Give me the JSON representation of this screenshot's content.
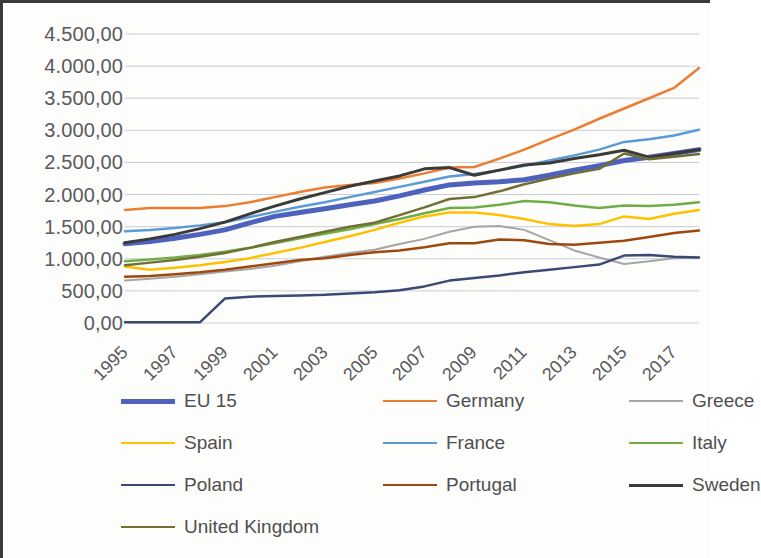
{
  "chart_data": {
    "type": "line",
    "title": "",
    "xlabel": "",
    "ylabel": "",
    "grid": true,
    "legend_position": "bottom",
    "ylim": [
      0,
      4500
    ],
    "ytick_labels": [
      "4.500,00",
      "4.000,00",
      "3.500,00",
      "3.000,00",
      "2.500,00",
      "2.000,00",
      "1.500,00",
      "1.000,00",
      "500,00",
      "0,00"
    ],
    "ytick_values": [
      4500,
      4000,
      3500,
      3000,
      2500,
      2000,
      1500,
      1000,
      500,
      0
    ],
    "xtick_labels": [
      "1995",
      "1997",
      "1999",
      "2001",
      "2003",
      "2005",
      "2007",
      "2009",
      "2011",
      "2013",
      "2015",
      "2017"
    ],
    "x": [
      1995,
      1996,
      1997,
      1998,
      1999,
      2000,
      2001,
      2002,
      2003,
      2004,
      2005,
      2006,
      2007,
      2008,
      2009,
      2010,
      2011,
      2012,
      2013,
      2014,
      2015,
      2016,
      2017,
      2018
    ],
    "series": [
      {
        "name": "EU 15",
        "color": "#4d61bd",
        "width": 5,
        "values": [
          1235,
          1270,
          1320,
          1380,
          1450,
          1560,
          1660,
          1720,
          1780,
          1840,
          1900,
          1980,
          2070,
          2150,
          2180,
          2200,
          2230,
          2300,
          2380,
          2450,
          2530,
          2580,
          2640,
          2700
        ]
      },
      {
        "name": "Germany",
        "color": "#ed7d31",
        "width": 2.5,
        "values": [
          1760,
          1790,
          1790,
          1790,
          1820,
          1880,
          1960,
          2040,
          2110,
          2150,
          2180,
          2250,
          2330,
          2420,
          2430,
          2560,
          2700,
          2860,
          3010,
          3180,
          3340,
          3500,
          3660,
          3970
        ]
      },
      {
        "name": "Greece",
        "color": "#a5a5a5",
        "width": 2,
        "values": [
          660,
          690,
          720,
          760,
          800,
          840,
          890,
          960,
          1030,
          1090,
          1140,
          1230,
          1310,
          1420,
          1500,
          1510,
          1450,
          1290,
          1130,
          1020,
          920,
          960,
          1010,
          1020
        ]
      },
      {
        "name": "Spain",
        "color": "#ffc000",
        "width": 2.5,
        "values": [
          880,
          830,
          860,
          900,
          950,
          1010,
          1090,
          1170,
          1260,
          1350,
          1450,
          1560,
          1660,
          1720,
          1720,
          1680,
          1620,
          1540,
          1510,
          1540,
          1660,
          1620,
          1700,
          1760
        ]
      },
      {
        "name": "France",
        "color": "#5b9bd5",
        "width": 2.5,
        "values": [
          1430,
          1450,
          1480,
          1520,
          1570,
          1650,
          1730,
          1810,
          1880,
          1960,
          2040,
          2120,
          2200,
          2280,
          2320,
          2380,
          2450,
          2530,
          2610,
          2700,
          2820,
          2860,
          2920,
          3010
        ]
      },
      {
        "name": "Italy",
        "color": "#70ad47",
        "width": 2.5,
        "values": [
          960,
          990,
          1020,
          1060,
          1110,
          1170,
          1240,
          1320,
          1390,
          1460,
          1540,
          1620,
          1710,
          1790,
          1800,
          1840,
          1900,
          1880,
          1830,
          1790,
          1830,
          1820,
          1840,
          1880
        ]
      },
      {
        "name": "Poland",
        "color": "#3b4a74",
        "width": 2.5,
        "values": [
          10,
          10,
          10,
          10,
          380,
          410,
          420,
          430,
          440,
          460,
          480,
          510,
          570,
          660,
          700,
          740,
          790,
          830,
          870,
          910,
          1050,
          1060,
          1030,
          1020
        ]
      },
      {
        "name": "Portugal",
        "color": "#9e480e",
        "width": 2.5,
        "values": [
          720,
          730,
          760,
          790,
          830,
          880,
          930,
          980,
          1010,
          1060,
          1100,
          1130,
          1180,
          1240,
          1240,
          1300,
          1290,
          1230,
          1220,
          1250,
          1280,
          1340,
          1400,
          1440
        ]
      },
      {
        "name": "Sweden",
        "color": "#3a3a38",
        "width": 3,
        "values": [
          1250,
          1310,
          1380,
          1470,
          1570,
          1700,
          1820,
          1930,
          2030,
          2130,
          2210,
          2290,
          2400,
          2420,
          2300,
          2380,
          2460,
          2490,
          2560,
          2620,
          2690,
          2580,
          2640,
          2700
        ]
      },
      {
        "name": "United Kingdom",
        "color": "#726f34",
        "width": 2.5,
        "values": [
          900,
          940,
          980,
          1030,
          1090,
          1170,
          1260,
          1340,
          1420,
          1500,
          1560,
          1680,
          1800,
          1930,
          1960,
          2050,
          2160,
          2250,
          2330,
          2400,
          2640,
          2550,
          2590,
          2630
        ]
      }
    ]
  },
  "legend": {
    "items": [
      {
        "label": "EU 15"
      },
      {
        "label": "Germany"
      },
      {
        "label": "Greece"
      },
      {
        "label": "Spain"
      },
      {
        "label": "France"
      },
      {
        "label": "Italy"
      },
      {
        "label": "Poland"
      },
      {
        "label": "Portugal"
      },
      {
        "label": "Sweden"
      },
      {
        "label": "United Kingdom"
      }
    ]
  }
}
